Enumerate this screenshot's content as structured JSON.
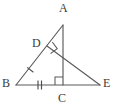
{
  "figure": {
    "background_color": "#ffffff",
    "stroke_color": "#5a5a5a",
    "label_color": "#3b3b3b",
    "points": [
      {
        "id": "A",
        "label": "A",
        "x": 63,
        "y": 25,
        "label_x": 59,
        "label_y": 3
      },
      {
        "id": "B",
        "label": "B",
        "x": 16,
        "y": 85,
        "label_x": 2,
        "label_y": 78
      },
      {
        "id": "C",
        "label": "C",
        "x": 63,
        "y": 85,
        "label_x": 59,
        "label_y": 92
      },
      {
        "id": "D",
        "label": "D",
        "x": 47,
        "y": 46,
        "label_x": 32,
        "label_y": 38
      },
      {
        "id": "E",
        "label": "E",
        "x": 100,
        "y": 85,
        "label_x": 103,
        "label_y": 78
      }
    ],
    "segments": [
      {
        "id": "BA",
        "from": "B",
        "to": "A",
        "label": "segment-b-a"
      },
      {
        "id": "BE",
        "from": "B",
        "to": "E",
        "label": "segment-b-e"
      },
      {
        "id": "AC",
        "from": "A",
        "to": "C",
        "label": "segment-a-c"
      },
      {
        "id": "DE",
        "from": "D",
        "to": "E",
        "label": "segment-d-e"
      }
    ],
    "right_angle_marks": [
      {
        "id": "angle-D",
        "at": "D",
        "note": "right angle between BA and DE"
      },
      {
        "id": "angle-C",
        "at": "C",
        "note": "right angle between AC and BC"
      }
    ],
    "congruence_ticks": [
      {
        "id": "tick-BD",
        "on": "BD",
        "count": 1
      },
      {
        "id": "tick-BC",
        "on": "BC",
        "count": 2
      }
    ]
  }
}
